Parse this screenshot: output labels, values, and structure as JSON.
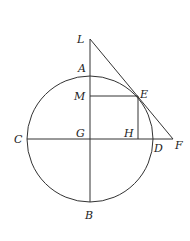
{
  "diagram": {
    "type": "geometry",
    "stroke_color": "#333333",
    "circle": {
      "center": "G",
      "cx": 90,
      "cy": 139,
      "r": 63
    },
    "points": {
      "L": {
        "label": "L",
        "x": 90,
        "y": 39
      },
      "A": {
        "label": "A",
        "x": 90,
        "y": 76
      },
      "M": {
        "label": "M",
        "x": 90,
        "y": 96
      },
      "E": {
        "label": "E",
        "x": 138,
        "y": 96
      },
      "C": {
        "label": "C",
        "x": 27,
        "y": 139
      },
      "G": {
        "label": "G",
        "x": 90,
        "y": 139
      },
      "H": {
        "label": "H",
        "x": 138,
        "y": 139
      },
      "D": {
        "label": "D",
        "x": 153,
        "y": 139
      },
      "F": {
        "label": "F",
        "x": 173,
        "y": 139
      },
      "B": {
        "label": "B",
        "x": 90,
        "y": 202
      }
    },
    "segments": [
      [
        "L",
        "B"
      ],
      [
        "C",
        "F"
      ],
      [
        "L",
        "F"
      ],
      [
        "M",
        "E"
      ],
      [
        "E",
        "H"
      ]
    ]
  }
}
